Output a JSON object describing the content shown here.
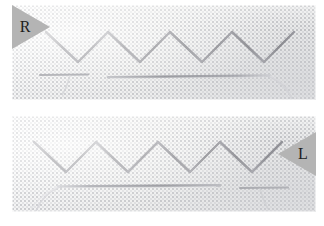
{
  "image": {
    "subject": "Herringbone embroidery stitch worked in two directions on even-weave fabric",
    "width": 324,
    "height": 226,
    "background_color": "#ffffff"
  },
  "panels": [
    {
      "id": "top",
      "label": "R",
      "label_position": "top-left",
      "label_wedge_color": "#b4b4b4",
      "label_text_color": "#1d1d1d",
      "caption": "Right-handed herringbone sample, needle exits at the right",
      "fabric_color": "#f6f6f4",
      "thread_color": "#6e6e74",
      "stitch": {
        "name": "herringbone-stitch",
        "repeats": 4,
        "direction": "left-to-right",
        "top_bar_y": 27,
        "bottom_bar_y": 57,
        "bar_length": 26,
        "pitch": 62
      },
      "needle": {
        "color": "#8f9096",
        "x_start": 96,
        "x_end": 258,
        "y": 72,
        "eye_end": "right",
        "thread_tail": "curves down-right from the needle eye"
      },
      "loose_thread": {
        "x_start": 28,
        "x_end": 76,
        "y": 70
      }
    },
    {
      "id": "bottom",
      "label": "L",
      "label_position": "right",
      "label_wedge_color": "#b4b4b4",
      "label_text_color": "#1d1d1d",
      "caption": "Left-handed herringbone sample, mirror image of the upper row",
      "fabric_color": "#f6f6f4",
      "thread_color": "#6e6e74",
      "stitch": {
        "name": "herringbone-stitch",
        "repeats": 4,
        "direction": "right-to-left",
        "top_bar_y": 26,
        "bottom_bar_y": 56,
        "bar_length": 26,
        "pitch": 62
      },
      "needle": {
        "color": "#8f9096",
        "x_start": 46,
        "x_end": 208,
        "y": 70,
        "eye_end": "left",
        "thread_tail": "curves down-left from the needle eye"
      },
      "loose_thread": {
        "x_start": 228,
        "x_end": 276,
        "y": 72
      }
    }
  ]
}
